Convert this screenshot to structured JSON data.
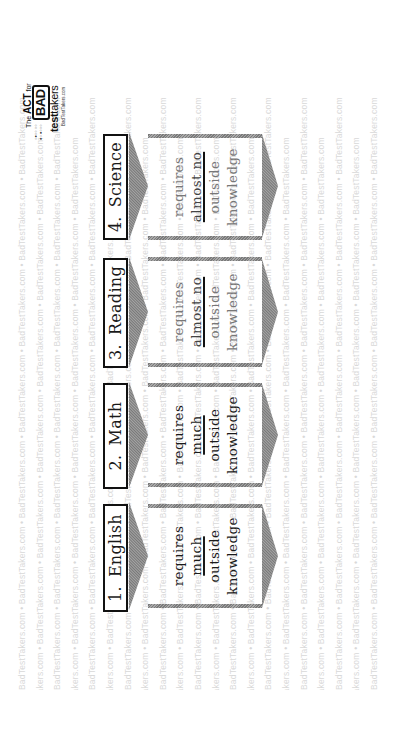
{
  "orientation": "rotated 90 degrees counter-clockwise",
  "logo": {
    "line1_pre": "The",
    "line1_brand": "ACT",
    "line1_post": "for",
    "badge": "BAD",
    "brand_bold": "test",
    "brand_regular": "takers",
    "url": "BadTestTakers.com"
  },
  "watermark": {
    "text": "BadTestTakers.com • BadTestTakers.com • BadTestTakers.com • BadTestTakers.com • BadTestTakers.com • BadTestTakers.com • BadTestTakers.com"
  },
  "sections": [
    {
      "number": "1.",
      "name": "English",
      "line1": "requires",
      "emphasis": "much",
      "line3": "outside",
      "line4": "knowledge",
      "tone": "dark"
    },
    {
      "number": "2.",
      "name": "Math",
      "line1": "requires",
      "emphasis": "much",
      "line3": "outside",
      "line4": "knowledge",
      "tone": "dark"
    },
    {
      "number": "3.",
      "name": "Reading",
      "line1": "requires",
      "emphasis": "almost no",
      "line3": "outside",
      "line4": "knowledge",
      "tone": "light"
    },
    {
      "number": "4.",
      "name": "Science",
      "line1": "requires",
      "emphasis": "almost no",
      "line3": "outside",
      "line4": "knowledge",
      "tone": "light"
    }
  ],
  "colors": {
    "header_border": "#111111",
    "chevron_gray": "#8f8f8f",
    "stripe_gray": "#8a8a8a",
    "watermark": "#d9d9d9",
    "text_dark": "#1a1a1a",
    "text_light": "#777777"
  }
}
